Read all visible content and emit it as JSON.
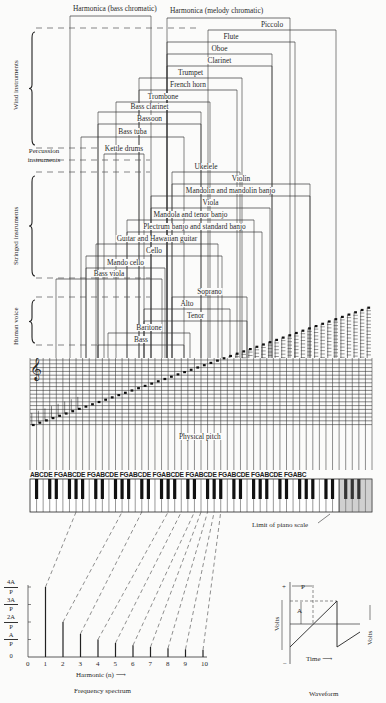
{
  "diagram": {
    "groups": [
      {
        "label": "Wind instruments"
      },
      {
        "label": "Percussion instruments"
      },
      {
        "label": "Stringed instruments"
      },
      {
        "label": "Human voice"
      }
    ],
    "instruments": [
      {
        "label": "Harmonica (bass chromatic)",
        "x1": 70,
        "x2": 151,
        "y": 16
      },
      {
        "label": "Harmonica (melody chromatic)",
        "x1": 167,
        "x2": 290,
        "y": 18
      },
      {
        "label": "Piccolo",
        "x1": 208,
        "x2": 336,
        "y": 30
      },
      {
        "label": "Flute",
        "x1": 167,
        "x2": 295,
        "y": 42
      },
      {
        "label": "Oboe",
        "x1": 167,
        "x2": 272,
        "y": 54
      },
      {
        "label": "Clarinet",
        "x1": 167,
        "x2": 272,
        "y": 66
      },
      {
        "label": "Trumpet",
        "x1": 139,
        "x2": 242,
        "y": 78
      },
      {
        "label": "French horn",
        "x1": 139,
        "x2": 237,
        "y": 90
      },
      {
        "label": "Trombone",
        "x1": 116,
        "x2": 210,
        "y": 102
      },
      {
        "label": "Bass clarinet",
        "x1": 98,
        "x2": 201,
        "y": 112
      },
      {
        "label": "Bassoon",
        "x1": 98,
        "x2": 201,
        "y": 124
      },
      {
        "label": "Bass tuba",
        "x1": 81,
        "x2": 184,
        "y": 137
      },
      {
        "label": "Kettle drums",
        "x1": 104,
        "x2": 144,
        "y": 154
      },
      {
        "label": "Ukelele",
        "x1": 172,
        "x2": 240,
        "y": 172
      },
      {
        "label": "Violin",
        "x1": 172,
        "x2": 310,
        "y": 184
      },
      {
        "label": "Mandolin and mandolin banjo",
        "x1": 151,
        "x2": 310,
        "y": 196
      },
      {
        "label": "Viola",
        "x1": 151,
        "x2": 270,
        "y": 208
      },
      {
        "label": "Mandola and tenor banjo",
        "x1": 127,
        "x2": 254,
        "y": 220
      },
      {
        "label": "Plectrum banjo and standard banjo",
        "x1": 127,
        "x2": 262,
        "y": 232
      },
      {
        "label": "Guitar and Hawaiian guitar",
        "x1": 96,
        "x2": 218,
        "y": 244
      },
      {
        "label": "Cello",
        "x1": 86,
        "x2": 222,
        "y": 256
      },
      {
        "label": "Mando cello",
        "x1": 86,
        "x2": 165,
        "y": 268
      },
      {
        "label": "Bass viola",
        "x1": 56,
        "x2": 162,
        "y": 279
      },
      {
        "label": "Soprano",
        "x1": 172,
        "x2": 247,
        "y": 297
      },
      {
        "label": "Alto",
        "x1": 144,
        "x2": 230,
        "y": 309
      },
      {
        "label": "Tenor",
        "x1": 144,
        "x2": 247,
        "y": 321
      },
      {
        "label": "Baritone",
        "x1": 108,
        "x2": 190,
        "y": 333
      },
      {
        "label": "Bass",
        "x1": 98,
        "x2": 184,
        "y": 345
      }
    ],
    "staff": {
      "clef": "𝄞",
      "label": "Physical pitch"
    },
    "keyboard": {
      "key_names": "ABCDE FGABCDE FGABCDE FGABCDE FGABCDE FGABCDE FGABCDE FGABCDE FGABC",
      "limit_label": "Limit of piano scale"
    },
    "spectrum": {
      "title": "Frequency spectrum",
      "xlabel": "Harmonic (n) ⟶",
      "x_ticks": [
        "0",
        "1",
        "2",
        "3",
        "4",
        "5",
        "6",
        "7",
        "8",
        "9",
        "10"
      ],
      "y_ticks": [
        {
          "num": "4A",
          "den": "P"
        },
        {
          "num": "3A",
          "den": "P"
        },
        {
          "num": "2A",
          "den": "P"
        },
        {
          "num": "A",
          "den": "P"
        },
        {
          "num": "0",
          "den": ""
        }
      ]
    },
    "waveform": {
      "title": "Waveform",
      "period_label": "P",
      "amplitude_label": "A",
      "plus": "+",
      "minus": "−",
      "volts_left": "Volts",
      "volts_right": "Volts",
      "time_label": "Time ⟶"
    }
  },
  "chart_data": {
    "type": "bar",
    "title": "Frequency spectrum",
    "xlabel": "Harmonic (n)",
    "ylabel": "Amplitude",
    "categories": [
      "1",
      "2",
      "3",
      "4",
      "5",
      "6",
      "7",
      "8",
      "9",
      "10"
    ],
    "values": [
      4.0,
      2.0,
      1.33,
      1.0,
      0.8,
      0.67,
      0.57,
      0.5,
      0.44,
      0.4
    ],
    "y_tick_labels": [
      "0",
      "A/P",
      "2A/P",
      "3A/P",
      "4A/P"
    ],
    "ylim": [
      0,
      4
    ],
    "grid": false
  }
}
